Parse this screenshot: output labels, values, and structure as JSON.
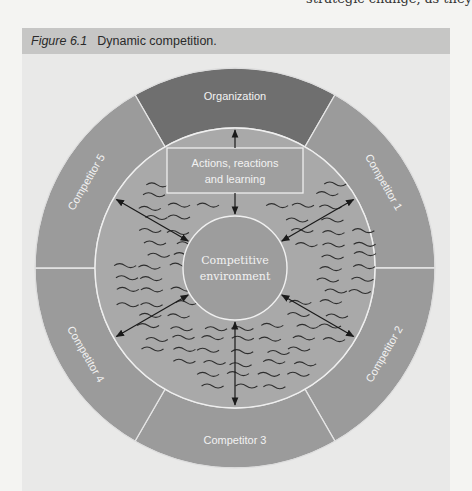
{
  "page": {
    "cut_off_text": "strategic change, as they"
  },
  "figure": {
    "number": "Figure 6.1",
    "title": "Dynamic competition."
  },
  "diagram": {
    "outer_segments": [
      {
        "id": "organization",
        "label": "Organization",
        "start_deg": -120,
        "end_deg": -60,
        "color": "#6f6f6f"
      },
      {
        "id": "competitor-1",
        "label": "Competitor 1",
        "start_deg": -60,
        "end_deg": 0,
        "color": "#9b9b9b"
      },
      {
        "id": "competitor-2",
        "label": "Competitor 2",
        "start_deg": 0,
        "end_deg": 60,
        "color": "#9b9b9b"
      },
      {
        "id": "competitor-3",
        "label": "Competitor 3",
        "start_deg": 60,
        "end_deg": 120,
        "color": "#9b9b9b"
      },
      {
        "id": "competitor-4",
        "label": "Competitor 4",
        "start_deg": 120,
        "end_deg": 180,
        "color": "#9b9b9b"
      },
      {
        "id": "competitor-5",
        "label": "Competitor 5",
        "start_deg": 180,
        "end_deg": 240,
        "color": "#9b9b9b"
      }
    ],
    "middle_ring": {
      "label": "Actions, reactions and learning",
      "line1": "Actions, reactions",
      "line2": "and learning",
      "color": "#a9a9a9"
    },
    "center": {
      "line1": "Competitive",
      "line2": "environment",
      "color": "#9d9d9d"
    },
    "arrows": [
      {
        "from": "actions-box",
        "to": "organization",
        "type": "single"
      },
      {
        "from": "actions-box",
        "to": "competitive-environment",
        "type": "single"
      },
      {
        "between": [
          "competitive-environment",
          "competitor-1"
        ],
        "type": "double"
      },
      {
        "between": [
          "competitive-environment",
          "competitor-2"
        ],
        "type": "double"
      },
      {
        "between": [
          "competitive-environment",
          "competitor-3"
        ],
        "type": "double"
      },
      {
        "between": [
          "competitive-environment",
          "competitor-4"
        ],
        "type": "double"
      },
      {
        "between": [
          "competitive-environment",
          "competitor-5"
        ],
        "type": "double"
      }
    ],
    "colors": {
      "panel_bg": "#e9e9e8",
      "caption_bar": "#c6c6c5",
      "divider": "#e6e6e6",
      "wave": "#2e2e2e",
      "arrow": "#1a1a1a"
    }
  }
}
